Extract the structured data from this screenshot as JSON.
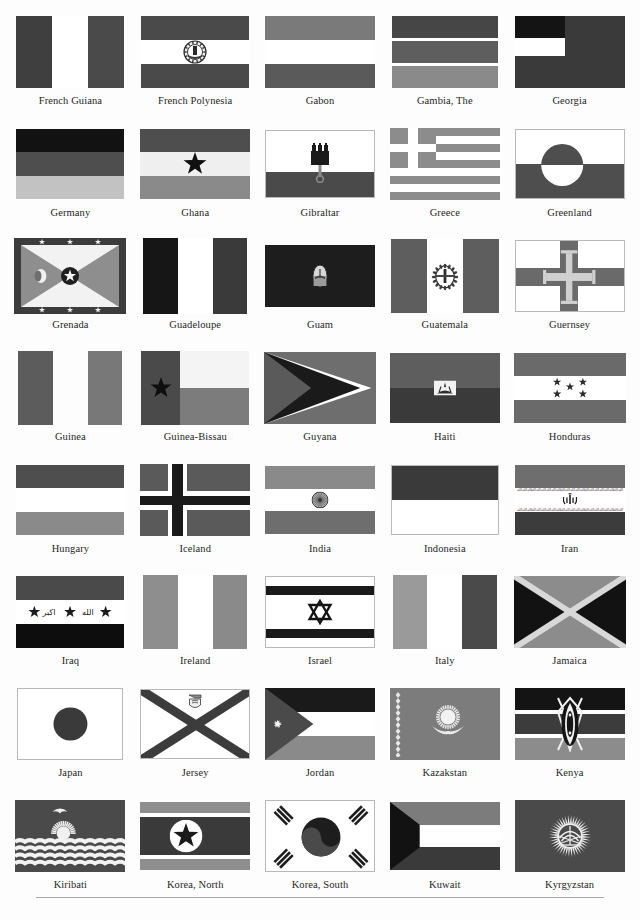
{
  "page": {
    "style": "grayscale print plate",
    "columns": 5,
    "rows": 8,
    "rule_at_bottom": true
  },
  "palette": {
    "black": "#111111",
    "dark_gray": "#3f3f3f",
    "mid_gray": "#5c5c5c",
    "gray": "#707070",
    "light_gray": "#9a9a9a",
    "pale_gray": "#c4c4c4",
    "white": "#ffffff",
    "border": "#b9b9b9",
    "text": "#262626"
  },
  "flags": [
    {
      "name": "French Guiana",
      "w": 108,
      "h": 72,
      "type": "vertical3",
      "bands": [
        "#3f3f3f",
        "#ffffff",
        "#4a4a4a"
      ],
      "border": false
    },
    {
      "name": "French Polynesia",
      "w": 108,
      "h": 72,
      "type": "horiz3-emblem",
      "bands": [
        "#4a4a4a",
        "#ffffff",
        "#4a4a4a"
      ],
      "emblem": "polynesia-emblem",
      "border": false
    },
    {
      "name": "Gabon",
      "w": 110,
      "h": 72,
      "type": "horiz3",
      "bands": [
        "#7a7a7a",
        "#ffffff",
        "#5a5a5a"
      ],
      "border": false
    },
    {
      "name": "Gambia, The",
      "w": 106,
      "h": 72,
      "type": "horiz5",
      "bands": [
        "#464646",
        "#ffffff",
        "#5e5e5e",
        "#ffffff",
        "#8a8a8a"
      ],
      "border": false
    },
    {
      "name": "Georgia",
      "w": 110,
      "h": 72,
      "type": "georgia",
      "bands": [
        "#141414",
        "#ffffff",
        "#3a3a3a"
      ],
      "border": false
    },
    {
      "name": "Germany",
      "w": 108,
      "h": 70,
      "type": "horiz3",
      "bands": [
        "#121212",
        "#4e4e4e",
        "#c2c2c2"
      ],
      "border": false
    },
    {
      "name": "Ghana",
      "w": 110,
      "h": 70,
      "type": "horiz3-star",
      "bands": [
        "#4e4e4e",
        "#efefef",
        "#8a8a8a"
      ],
      "emblem": "black-star",
      "border": false
    },
    {
      "name": "Gibraltar",
      "w": 110,
      "h": 68,
      "type": "gibraltar",
      "bands": [
        "#ffffff",
        "#4a4a4a"
      ],
      "emblem": "castle-key-emblem",
      "border": true
    },
    {
      "name": "Greece",
      "w": 110,
      "h": 72,
      "type": "greece",
      "bands": [
        "#8c8c8c",
        "#ffffff"
      ],
      "border": false
    },
    {
      "name": "Greenland",
      "w": 110,
      "h": 70,
      "type": "greenland",
      "bands": [
        "#ffffff",
        "#4e4e4e"
      ],
      "border": true
    },
    {
      "name": "Grenada",
      "w": 112,
      "h": 76,
      "type": "grenada",
      "bands": [
        "#3c3c3c",
        "#8e8e8e",
        "#f2f2f2"
      ],
      "border": false
    },
    {
      "name": "Guadeloupe",
      "w": 104,
      "h": 76,
      "type": "vertical3",
      "bands": [
        "#161616",
        "#ffffff",
        "#3a3a3a"
      ],
      "border": false
    },
    {
      "name": "Guam",
      "w": 110,
      "h": 62,
      "type": "guam",
      "bands": [
        "#1d1d1d"
      ],
      "emblem": "guam-seal",
      "border": false
    },
    {
      "name": "Guatemala",
      "w": 108,
      "h": 74,
      "type": "vertical3-emblem",
      "bands": [
        "#5e5e5e",
        "#ffffff",
        "#5e5e5e"
      ],
      "emblem": "guatemala-seal",
      "border": false
    },
    {
      "name": "Guernsey",
      "w": 110,
      "h": 72,
      "type": "guernsey",
      "bands": [
        "#ffffff",
        "#6a6a6a",
        "#d0d0d0"
      ],
      "border": true
    },
    {
      "name": "Guinea",
      "w": 104,
      "h": 74,
      "type": "vertical3",
      "bands": [
        "#5c5c5c",
        "#fdfdfd",
        "#787878"
      ],
      "border": false
    },
    {
      "name": "Guinea-Bissau",
      "w": 108,
      "h": 74,
      "type": "guineabissau",
      "bands": [
        "#4a4a4a",
        "#f4f4f4",
        "#7c7c7c"
      ],
      "emblem": "black-star",
      "border": false
    },
    {
      "name": "Guyana",
      "w": 112,
      "h": 72,
      "type": "guyana",
      "bands": [
        "#6e6e6e",
        "#ffffff",
        "#1a1a1a",
        "#5a5a5a"
      ],
      "border": false
    },
    {
      "name": "Haiti",
      "w": 110,
      "h": 70,
      "type": "horiz2-emblem",
      "bands": [
        "#5e5e5e",
        "#3a3a3a"
      ],
      "emblem": "haiti-arms",
      "border": false
    },
    {
      "name": "Honduras",
      "w": 112,
      "h": 70,
      "type": "honduras",
      "bands": [
        "#6a6a6a",
        "#ffffff",
        "#6a6a6a"
      ],
      "emblem": "five-stars",
      "border": false
    },
    {
      "name": "Hungary",
      "w": 108,
      "h": 70,
      "type": "horiz3",
      "bands": [
        "#4e4e4e",
        "#ffffff",
        "#8a8a8a"
      ],
      "border": false
    },
    {
      "name": "Iceland",
      "w": 110,
      "h": 72,
      "type": "nordic",
      "bands": [
        "#5a5a5a",
        "#ffffff",
        "#1a1a1a"
      ],
      "border": false
    },
    {
      "name": "India",
      "w": 110,
      "h": 68,
      "type": "horiz3-wheel",
      "bands": [
        "#8a8a8a",
        "#ffffff",
        "#6e6e6e"
      ],
      "emblem": "ashoka-chakra",
      "border": false
    },
    {
      "name": "Indonesia",
      "w": 108,
      "h": 70,
      "type": "horiz2",
      "bands": [
        "#3a3a3a",
        "#ffffff"
      ],
      "border": true
    },
    {
      "name": "Iran",
      "w": 110,
      "h": 70,
      "type": "iran",
      "bands": [
        "#6e6e6e",
        "#ffffff",
        "#3c3c3c"
      ],
      "emblem": "iran-emblem",
      "border": false
    },
    {
      "name": "Iraq",
      "w": 108,
      "h": 72,
      "type": "iraq",
      "bands": [
        "#4a4a4a",
        "#ffffff",
        "#0d0d0d"
      ],
      "emblem": "three-stars-script",
      "border": false
    },
    {
      "name": "Ireland",
      "w": 104,
      "h": 74,
      "type": "vertical3",
      "bands": [
        "#8e8e8e",
        "#ffffff",
        "#8a8a8a"
      ],
      "border": false
    },
    {
      "name": "Israel",
      "w": 110,
      "h": 72,
      "type": "israel",
      "bands": [
        "#ffffff",
        "#1a1a1a"
      ],
      "emblem": "star-of-david",
      "border": true
    },
    {
      "name": "Italy",
      "w": 104,
      "h": 74,
      "type": "vertical3",
      "bands": [
        "#9a9a9a",
        "#ffffff",
        "#4a4a4a"
      ],
      "border": false
    },
    {
      "name": "Jamaica",
      "w": 112,
      "h": 72,
      "type": "jamaica",
      "bands": [
        "#121212",
        "#8c8c8c",
        "#d8d8d8"
      ],
      "border": false
    },
    {
      "name": "Japan",
      "w": 106,
      "h": 72,
      "type": "japan",
      "bands": [
        "#ffffff",
        "#3a3a3a"
      ],
      "border": true
    },
    {
      "name": "Jersey",
      "w": 110,
      "h": 70,
      "type": "jersey",
      "bands": [
        "#ffffff",
        "#3c3c3c"
      ],
      "emblem": "jersey-crest",
      "border": true
    },
    {
      "name": "Jordan",
      "w": 110,
      "h": 72,
      "type": "jordan",
      "bands": [
        "#1a1a1a",
        "#ffffff",
        "#8a8a8a",
        "#4a4a4a"
      ],
      "emblem": "white-star",
      "border": false
    },
    {
      "name": "Kazakstan",
      "w": 110,
      "h": 72,
      "type": "kazakstan",
      "bands": [
        "#7c7c7c"
      ],
      "emblem": "sun-eagle",
      "border": false
    },
    {
      "name": "Kenya",
      "w": 110,
      "h": 72,
      "type": "kenya",
      "bands": [
        "#141414",
        "#3c3c3c",
        "#8c8c8c"
      ],
      "emblem": "maasai-shield",
      "border": false
    },
    {
      "name": "Kiribati",
      "w": 110,
      "h": 72,
      "type": "kiribati",
      "bands": [
        "#4a4a4a",
        "#3a3a3a"
      ],
      "emblem": "frigatebird-sun-waves",
      "border": false
    },
    {
      "name": "Korea, North",
      "w": 110,
      "h": 68,
      "type": "koreanorth",
      "bands": [
        "#8e8e8e",
        "#ffffff",
        "#3a3a3a"
      ],
      "emblem": "star-in-circle",
      "border": false
    },
    {
      "name": "Korea, South",
      "w": 110,
      "h": 72,
      "type": "koreasouth",
      "bands": [
        "#ffffff",
        "#1d1d1d"
      ],
      "emblem": "taegeuk-trigrams",
      "border": true
    },
    {
      "name": "Kuwait",
      "w": 110,
      "h": 68,
      "type": "kuwait",
      "bands": [
        "#7c7c7c",
        "#ffffff",
        "#3a3a3a",
        "#121212"
      ],
      "border": false
    },
    {
      "name": "Kyrgyzstan",
      "w": 110,
      "h": 72,
      "type": "kyrgyzstan",
      "bands": [
        "#4a4a4a"
      ],
      "emblem": "sun-yurt",
      "border": false
    }
  ]
}
